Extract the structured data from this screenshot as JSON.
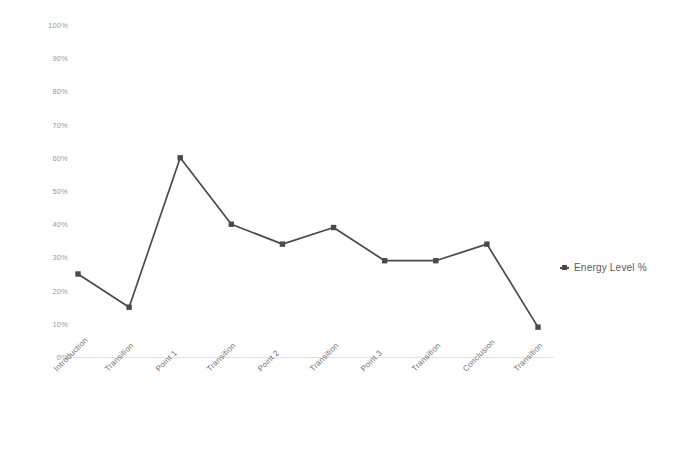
{
  "chart_data": {
    "type": "line",
    "title": "",
    "xlabel": "",
    "ylabel": "",
    "ylim": [
      0,
      100
    ],
    "grid": false,
    "legend_position": "right",
    "categories": [
      "Introduction",
      "Transition",
      "Point 1",
      "Transition",
      "Point 2",
      "Transition",
      "Point 3",
      "Transition",
      "Conclusion",
      "Transition"
    ],
    "series": [
      {
        "name": "Energy Level %",
        "color": "#4a4a4a",
        "marker": "square",
        "values": [
          25,
          15,
          60,
          40,
          34,
          39,
          29,
          29,
          34,
          9
        ]
      }
    ],
    "y_ticks": [
      "0%",
      "10%",
      "20%",
      "30%",
      "40%",
      "50%",
      "60%",
      "70%",
      "80%",
      "90%",
      "100%"
    ],
    "y_tick_values": [
      0,
      10,
      20,
      30,
      40,
      50,
      60,
      70,
      80,
      90,
      100
    ]
  },
  "legend": {
    "entries": [
      {
        "label": "Energy Level %",
        "color": "#4a4a4a"
      }
    ]
  },
  "colors": {
    "series": "#4a4a4a",
    "axis_text": "#9a9a9a",
    "category_text": "#6e6e6e",
    "baseline": "#e2e2e2",
    "background": "#ffffff"
  }
}
